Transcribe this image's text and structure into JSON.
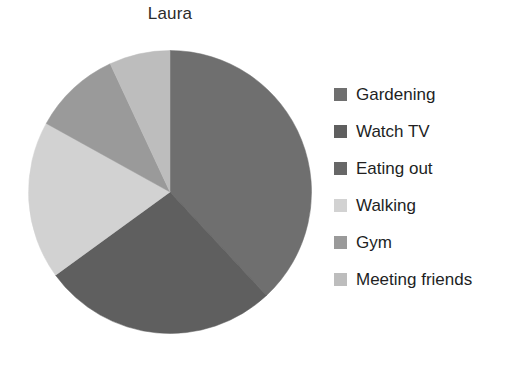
{
  "chart_data": {
    "type": "pie",
    "title": "Laura",
    "xlabel": "",
    "ylabel": "",
    "legend_position": "right",
    "grid": false,
    "start_angle_deg": 0,
    "direction": "clockwise",
    "categories": [
      "Gardening",
      "Watch TV",
      "Eating out",
      "Walking",
      "Gym",
      "Meeting friends"
    ],
    "values": [
      38,
      27,
      0,
      18,
      10,
      7
    ],
    "units": "percent",
    "colors": [
      "#6f6f6f",
      "#5f5f5f",
      "#676767",
      "#d2d2d2",
      "#9a9a9a",
      "#bdbdbd"
    ],
    "slices": [
      {
        "label": "Gardening",
        "value": 38,
        "color": "#6f6f6f",
        "start_deg": 0,
        "end_deg": 137
      },
      {
        "label": "Watch TV",
        "value": 27,
        "color": "#5f5f5f",
        "start_deg": 137,
        "end_deg": 234
      },
      {
        "label": "Eating out",
        "value": 0,
        "color": "#676767",
        "start_deg": 234,
        "end_deg": 234
      },
      {
        "label": "Walking",
        "value": 18,
        "color": "#d2d2d2",
        "start_deg": 234,
        "end_deg": 299
      },
      {
        "label": "Gym",
        "value": 10,
        "color": "#9a9a9a",
        "start_deg": 299,
        "end_deg": 335
      },
      {
        "label": "Meeting friends",
        "value": 7,
        "color": "#bdbdbd",
        "start_deg": 335,
        "end_deg": 360
      }
    ]
  },
  "title": {
    "text": "Laura"
  },
  "legend": {
    "items": [
      {
        "label": "Gardening",
        "color": "#6f6f6f"
      },
      {
        "label": "Watch TV",
        "color": "#5f5f5f"
      },
      {
        "label": "Eating out",
        "color": "#676767"
      },
      {
        "label": "Walking",
        "color": "#d2d2d2"
      },
      {
        "label": "Gym",
        "color": "#9a9a9a"
      },
      {
        "label": "Meeting friends",
        "color": "#bdbdbd"
      }
    ]
  }
}
